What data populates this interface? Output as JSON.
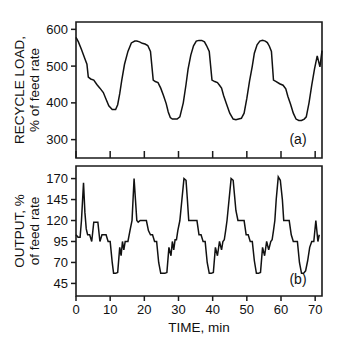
{
  "figure": {
    "background_color": "#ffffff",
    "line_color": "#111111",
    "axis_color": "#1a1a1a"
  },
  "chart_data": [
    {
      "type": "line",
      "panel_label": "(a)",
      "title": "",
      "xlabel": "",
      "ylabel": "RECYCLE LOAD, % of feed rate",
      "ylabel_line1": "RECYCLE LOAD,",
      "ylabel_line2": "% of feed rate",
      "xlim": [
        0,
        72
      ],
      "ylim": [
        250,
        620
      ],
      "xticks": [
        0,
        10,
        20,
        30,
        40,
        50,
        60,
        70
      ],
      "xtick_labels": [
        "",
        "",
        "",
        "",
        "",
        "",
        "",
        ""
      ],
      "yticks": [
        300,
        400,
        500,
        600
      ],
      "ytick_labels": [
        "300",
        "400",
        "500",
        "600"
      ],
      "grid": false,
      "legend": null,
      "series": [
        {
          "name": "recycle load",
          "x": [
            0.0,
            0.7,
            1.6,
            2.6,
            3.2,
            3.6,
            4.3,
            5.2,
            6.1,
            7.0,
            8.0,
            8.8,
            9.6,
            10.6,
            11.6,
            12.2,
            12.8,
            13.4,
            14.2,
            15.2,
            16.2,
            17.2,
            17.8,
            18.6,
            19.4,
            20.2,
            21.0,
            21.8,
            22.6,
            23.2,
            24.0,
            24.8,
            25.6,
            26.4,
            27.0,
            27.6,
            28.2,
            28.8,
            29.6,
            30.4,
            31.4,
            32.2,
            32.8,
            33.6,
            34.4,
            35.2,
            36.0,
            36.8,
            37.6,
            38.2,
            39.0,
            39.8,
            40.6,
            41.4,
            42.0,
            42.6,
            43.2,
            44.0,
            45.0,
            46.0,
            46.8,
            47.6,
            48.4,
            49.2,
            50.0,
            50.8,
            51.6,
            52.2,
            53.0,
            53.8,
            54.6,
            55.4,
            56.0,
            56.6,
            57.2,
            57.8,
            58.6,
            59.6,
            60.6,
            61.4,
            62.0,
            62.8,
            63.6,
            64.4,
            65.2,
            66.0,
            66.8,
            67.4,
            68.2,
            69.0,
            69.8,
            70.6,
            71.4,
            72.0
          ],
          "y": [
            578,
            566,
            545,
            520,
            505,
            470,
            465,
            462,
            450,
            440,
            428,
            410,
            392,
            382,
            382,
            395,
            425,
            462,
            505,
            540,
            563,
            568,
            568,
            566,
            562,
            560,
            556,
            540,
            462,
            458,
            455,
            440,
            420,
            398,
            375,
            360,
            356,
            356,
            356,
            362,
            400,
            450,
            492,
            530,
            555,
            568,
            570,
            570,
            566,
            556,
            540,
            462,
            458,
            455,
            448,
            440,
            420,
            398,
            372,
            356,
            354,
            356,
            358,
            372,
            412,
            460,
            500,
            535,
            558,
            568,
            570,
            568,
            564,
            554,
            540,
            462,
            458,
            452,
            448,
            438,
            418,
            396,
            372,
            356,
            352,
            352,
            356,
            362,
            400,
            448,
            492,
            528,
            498,
            542
          ]
        }
      ]
    },
    {
      "type": "line",
      "panel_label": "(b)",
      "title": "",
      "xlabel": "TIME, min",
      "ylabel": "OUTPUT, % of feed rate",
      "ylabel_line1": "OUTPUT, %",
      "ylabel_line2": "of feed rate",
      "xlim": [
        0,
        72
      ],
      "ylim": [
        30,
        185
      ],
      "xticks": [
        0,
        10,
        20,
        30,
        40,
        50,
        60,
        70
      ],
      "xtick_labels": [
        "0",
        "10",
        "20",
        "30",
        "40",
        "50",
        "60",
        "70"
      ],
      "yticks": [
        45,
        70,
        95,
        120,
        145,
        170
      ],
      "ytick_labels": [
        "45",
        "70",
        "95",
        "120",
        "145",
        "170"
      ],
      "grid": false,
      "legend": null,
      "series": [
        {
          "name": "output",
          "x": [
            0.0,
            0.6,
            1.2,
            1.6,
            2.2,
            2.6,
            3.0,
            3.4,
            4.0,
            4.6,
            5.2,
            5.8,
            6.4,
            7.0,
            7.6,
            8.2,
            8.8,
            9.4,
            10.0,
            10.6,
            11.0,
            11.6,
            12.2,
            12.8,
            13.2,
            13.6,
            14.0,
            14.4,
            14.8,
            15.2,
            15.8,
            16.4,
            17.0,
            17.4,
            17.8,
            18.2,
            18.8,
            19.4,
            20.0,
            20.6,
            21.2,
            21.8,
            22.4,
            23.0,
            23.6,
            24.2,
            24.8,
            25.4,
            26.0,
            26.6,
            27.2,
            27.8,
            28.2,
            28.6,
            29.0,
            29.4,
            29.8,
            30.4,
            31.0,
            31.6,
            32.2,
            32.6,
            33.0,
            33.6,
            34.2,
            34.8,
            35.4,
            36.0,
            36.6,
            37.2,
            37.8,
            38.4,
            39.0,
            39.6,
            40.2,
            40.8,
            41.4,
            42.0,
            42.6,
            43.0,
            43.4,
            43.8,
            44.2,
            44.8,
            45.4,
            46.0,
            46.4,
            46.8,
            47.4,
            48.0,
            48.6,
            49.2,
            49.8,
            50.4,
            51.0,
            51.6,
            52.2,
            52.8,
            53.4,
            54.0,
            54.6,
            55.2,
            55.8,
            56.4,
            57.0,
            57.4,
            57.8,
            58.2,
            58.6,
            59.2,
            59.8,
            60.4,
            60.8,
            61.2,
            61.8,
            62.4,
            63.0,
            63.6,
            64.2,
            64.8,
            65.4,
            66.0,
            66.6,
            67.2,
            67.8,
            68.4,
            69.0,
            69.6,
            70.2,
            70.8,
            71.2,
            71.6,
            72.0
          ],
          "y": [
            103,
            100,
            100,
            120,
            165,
            130,
            110,
            103,
            103,
            95,
            118,
            118,
            118,
            95,
            103,
            103,
            103,
            95,
            95,
            70,
            57,
            57,
            58,
            88,
            78,
            95,
            85,
            95,
            95,
            95,
            108,
            120,
            170,
            145,
            120,
            118,
            120,
            120,
            120,
            120,
            108,
            103,
            103,
            95,
            95,
            70,
            57,
            57,
            57,
            58,
            88,
            78,
            95,
            85,
            97,
            97,
            108,
            120,
            145,
            170,
            168,
            145,
            120,
            120,
            120,
            120,
            120,
            103,
            103,
            95,
            95,
            70,
            57,
            57,
            58,
            88,
            78,
            95,
            85,
            95,
            97,
            108,
            120,
            145,
            170,
            168,
            150,
            132,
            120,
            120,
            120,
            120,
            103,
            103,
            95,
            95,
            72,
            57,
            57,
            58,
            88,
            78,
            95,
            85,
            95,
            97,
            108,
            120,
            145,
            172,
            168,
            145,
            120,
            120,
            120,
            120,
            103,
            95,
            95,
            95,
            70,
            57,
            57,
            60,
            72,
            88,
            95,
            95,
            120,
            95,
            103
          ]
        }
      ]
    }
  ]
}
